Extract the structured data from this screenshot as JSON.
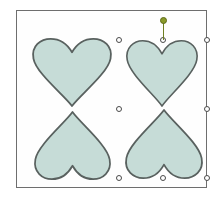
{
  "app": {
    "name": "shape-drawing-canvas",
    "background_color": "#ffffff"
  },
  "canvas": {
    "name": "artboard",
    "border_color": "#6e6e6e",
    "fill_color": "#fefefe",
    "x": 16,
    "y": 10,
    "width": 191,
    "height": 178
  },
  "style": {
    "shape_fill": "#c6dcd7",
    "shape_stroke": "#59615f",
    "handle_fill": "#ffffff",
    "handle_stroke": "#4a4a4a",
    "rotation_handle_color": "#8a9a2a",
    "rotation_stem_color": "#6f7f22"
  },
  "shapes": [
    {
      "id": "heart-top-left",
      "label": "Heart",
      "orientation": "upright",
      "selected": false,
      "x": 14,
      "y": 27,
      "width": 82,
      "height": 68
    },
    {
      "id": "heart-top-right",
      "label": "Heart",
      "orientation": "upright",
      "selected": true,
      "x": 108,
      "y": 29,
      "width": 74,
      "height": 66
    },
    {
      "id": "heart-bottom-left",
      "label": "Heart",
      "orientation": "inverted",
      "selected": false,
      "x": 16,
      "y": 101,
      "width": 79,
      "height": 68
    },
    {
      "id": "heart-bottom-right",
      "label": "Heart",
      "orientation": "inverted",
      "selected": true,
      "x": 107,
      "y": 99,
      "width": 80,
      "height": 69
    }
  ],
  "selection": {
    "label": "Selected shapes",
    "count": 2,
    "bounds": {
      "x": 102,
      "y": 29,
      "width": 88,
      "height": 138
    },
    "handles": [
      {
        "id": "handle-top-left",
        "position": "top-left",
        "x": 0,
        "y": 0
      },
      {
        "id": "handle-top-center",
        "position": "top-center",
        "x": 44,
        "y": 0
      },
      {
        "id": "handle-top-right",
        "position": "top-right",
        "x": 88,
        "y": 0
      },
      {
        "id": "handle-middle-left",
        "position": "middle-left",
        "x": 0,
        "y": 69
      },
      {
        "id": "handle-middle-right",
        "position": "middle-right",
        "x": 88,
        "y": 69
      },
      {
        "id": "handle-bottom-left",
        "position": "bottom-left",
        "x": 0,
        "y": 138
      },
      {
        "id": "handle-bottom-center",
        "position": "bottom-center",
        "x": 44,
        "y": 138
      },
      {
        "id": "handle-bottom-right",
        "position": "bottom-right",
        "x": 88,
        "y": 138
      }
    ],
    "rotation_handle": {
      "id": "rotation-handle",
      "label": "Rotate",
      "x": 44,
      "y": -20,
      "stem_length": 20
    }
  }
}
